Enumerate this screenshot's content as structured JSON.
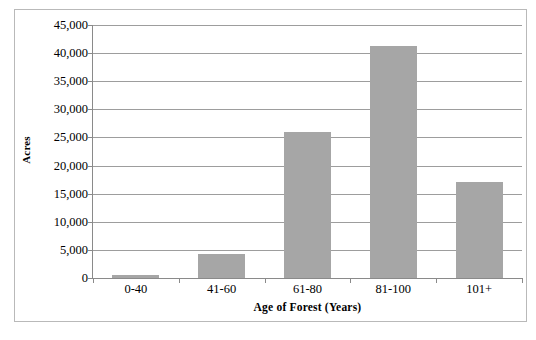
{
  "chart_data": {
    "type": "bar",
    "title": "",
    "subtitle": "",
    "categories": [
      "0-40",
      "41-60",
      "61-80",
      "81-100",
      "101+"
    ],
    "values": [
      500,
      4300,
      26000,
      41200,
      17000
    ],
    "series": [
      {
        "name": "Acres",
        "values": [
          500,
          4300,
          26000,
          41200,
          17000
        ]
      }
    ],
    "xlabel": "Age of Forest (Years)",
    "ylabel": "Acres",
    "ylim": [
      0,
      45000
    ],
    "ytick_step": 5000,
    "ytick_labels": [
      "0",
      "5,000",
      "10,000",
      "15,000",
      "20,000",
      "25,000",
      "30,000",
      "35,000",
      "40,000",
      "45,000"
    ],
    "ytick_values": [
      0,
      5000,
      10000,
      15000,
      20000,
      25000,
      30000,
      35000,
      40000,
      45000
    ],
    "grid": true,
    "grid_axis": "y",
    "legend": false,
    "legend_position": "none",
    "bar_color": "#a6a6a6",
    "gridline_color": "#9d9d9d",
    "axis_color": "#8a8a8a",
    "frame_color": "#b9b9b9",
    "background_color": "#ffffff"
  }
}
